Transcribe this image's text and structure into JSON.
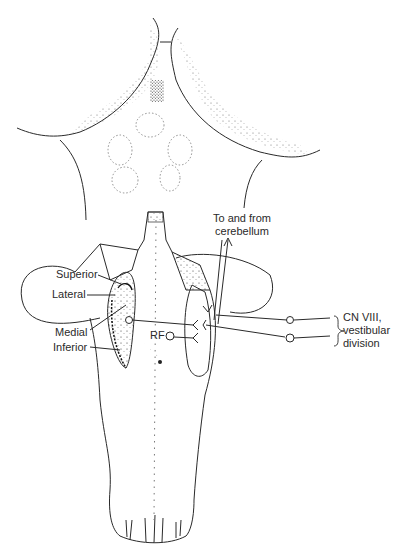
{
  "diagram": {
    "labels": {
      "superior": "Superior",
      "lateral": "Lateral",
      "medial": "Medial",
      "inferior": "Inferior",
      "rf": "RF",
      "cerebellum_line1": "To and from",
      "cerebellum_line2": "cerebellum",
      "cn_line1": "CN VIII,",
      "cn_line2": "vestibular",
      "cn_line3": "division"
    },
    "colors": {
      "ink": "#2a2a2a",
      "background": "#ffffff"
    }
  }
}
